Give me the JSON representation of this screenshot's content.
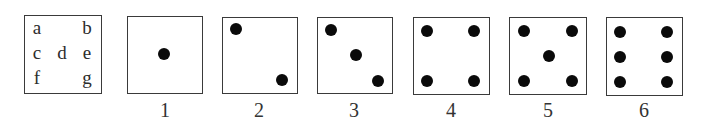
{
  "key_diagram": {
    "letters": [
      {
        "id": "a",
        "label": "a",
        "x": 37,
        "y": 27
      },
      {
        "id": "b",
        "label": "b",
        "x": 87,
        "y": 27
      },
      {
        "id": "c",
        "label": "c",
        "x": 37,
        "y": 52
      },
      {
        "id": "d",
        "label": "d",
        "x": 62,
        "y": 52
      },
      {
        "id": "e",
        "label": "e",
        "x": 87,
        "y": 52
      },
      {
        "id": "f",
        "label": "f",
        "x": 37,
        "y": 77
      },
      {
        "id": "g",
        "label": "g",
        "x": 87,
        "y": 77
      }
    ]
  },
  "faces": [
    {
      "label": "1",
      "pips": [
        "d"
      ]
    },
    {
      "label": "2",
      "pips": [
        "a",
        "g"
      ]
    },
    {
      "label": "3",
      "pips": [
        "a",
        "d",
        "g"
      ]
    },
    {
      "label": "4",
      "pips": [
        "a",
        "b",
        "f",
        "g"
      ]
    },
    {
      "label": "5",
      "pips": [
        "a",
        "b",
        "d",
        "f",
        "g"
      ]
    },
    {
      "label": "6",
      "pips": [
        "a",
        "b",
        "c",
        "e",
        "f",
        "g"
      ]
    }
  ],
  "colors": {
    "border": "#3a3a3a",
    "pip": "#0a0a0a",
    "text": "#2c2c2c",
    "background": "#ffffff"
  }
}
